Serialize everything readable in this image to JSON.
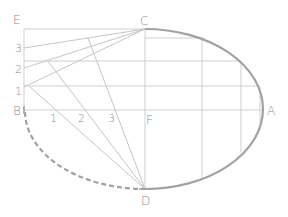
{
  "diagram": {
    "points": {
      "E": {
        "label": "E",
        "x": 24,
        "y": 29
      },
      "C": {
        "label": "C",
        "x": 145,
        "y": 29
      },
      "B": {
        "label": "B",
        "x": 24,
        "y": 110
      },
      "F": {
        "label": "F",
        "x": 145,
        "y": 110
      },
      "A": {
        "label": "A",
        "x": 263,
        "y": 110
      },
      "D": {
        "label": "D",
        "x": 145,
        "y": 189
      }
    },
    "side_divisions": [
      {
        "label": "3",
        "x": 24,
        "y": 48
      },
      {
        "label": "2",
        "x": 24,
        "y": 68
      },
      {
        "label": "1",
        "x": 24,
        "y": 87
      }
    ],
    "axis_divisions": [
      {
        "label": "1",
        "x": 56,
        "y": 110
      },
      {
        "label": "2",
        "x": 85,
        "y": 110
      },
      {
        "label": "3",
        "x": 115,
        "y": 110
      }
    ],
    "curve_points": [
      {
        "x": 30,
        "y": 87
      },
      {
        "x": 48,
        "y": 61
      },
      {
        "x": 88,
        "y": 38
      }
    ],
    "grid": {
      "horizontal_y": [
        38,
        61,
        86,
        110
      ],
      "vertical_x": [
        145,
        202,
        241,
        260
      ]
    },
    "colors": {
      "construction": "#cfcfcf",
      "ellipse": "#a2a2a2",
      "label": "#8c8c8c"
    }
  }
}
